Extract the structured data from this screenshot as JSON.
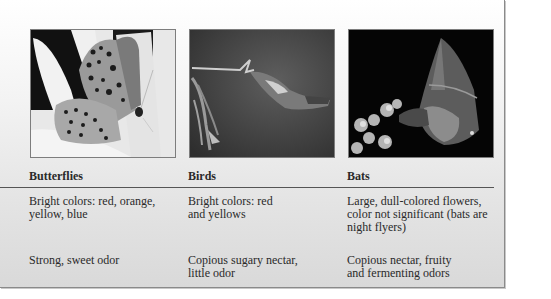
{
  "table": {
    "columns": [
      {
        "header": "Butterflies",
        "photo_alt": "butterfly-photo",
        "rows": [
          "Bright colors: red, orange,\nyellow, blue",
          "Strong, sweet odor"
        ]
      },
      {
        "header": "Birds",
        "photo_alt": "hummingbird-photo",
        "rows": [
          "Bright colors: red\nand yellows",
          "Copious sugary nectar,\nlittle odor"
        ]
      },
      {
        "header": "Bats",
        "photo_alt": "bat-photo",
        "rows": [
          "Large, dull-colored flowers,\ncolor not significant (bats are\nnight flyers)",
          "Copious nectar, fruity\nand fermenting odors"
        ]
      }
    ]
  },
  "colors": {
    "text": "#2a2a2a",
    "rule": "#555555",
    "panel_border": "#8a8a8a"
  }
}
